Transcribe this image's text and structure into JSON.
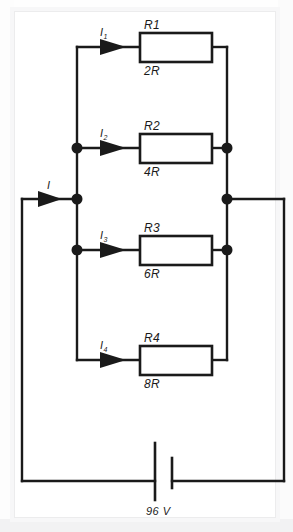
{
  "diagram": {
    "line_color": "#1a1a1a",
    "background": "#ffffff",
    "frame_color": "#ececed"
  },
  "source": {
    "name": "battery",
    "label": "96 V",
    "voltage": 96,
    "unit": "V"
  },
  "main_current": {
    "label": "I",
    "subscript": ""
  },
  "branches": [
    {
      "id": "branch-1",
      "resistor_name": "R1",
      "resistor_value": "2R",
      "current_label": "I",
      "current_subscript": "1"
    },
    {
      "id": "branch-2",
      "resistor_name": "R2",
      "resistor_value": "4R",
      "current_label": "I",
      "current_subscript": "2"
    },
    {
      "id": "branch-3",
      "resistor_name": "R3",
      "resistor_value": "6R",
      "current_label": "I",
      "current_subscript": "3"
    },
    {
      "id": "branch-4",
      "resistor_name": "R4",
      "resistor_value": "8R",
      "current_label": "I",
      "current_subscript": "4"
    }
  ]
}
